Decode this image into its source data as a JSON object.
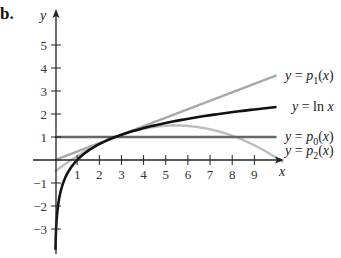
{
  "part_label": "b.",
  "chart_data": {
    "type": "line",
    "title": "",
    "xlabel": "x",
    "ylabel": "y",
    "xlim": [
      0,
      10.3
    ],
    "ylim": [
      -3.9,
      6.5
    ],
    "x_ticks": [
      1,
      2,
      3,
      4,
      5,
      6,
      7,
      8,
      9
    ],
    "y_ticks": [
      -3,
      -2,
      -1,
      1,
      2,
      3,
      4,
      5
    ],
    "grid": false,
    "legend_position": "right, inline labels at curve ends",
    "series": [
      {
        "name": "y = p1(x)",
        "label_main": "y = p",
        "label_sub": "1",
        "label_tail": "(x)",
        "expr": "x/e",
        "color": "#a8a8a8",
        "x_range": [
          0,
          10
        ],
        "points": [
          [
            0,
            0
          ],
          [
            2.718,
            1
          ],
          [
            5,
            1.84
          ],
          [
            10,
            3.68
          ]
        ]
      },
      {
        "name": "y = ln x",
        "label_main": "y = ln x",
        "label_sub": "",
        "label_tail": "",
        "expr": "ln(x)",
        "color": "#111111",
        "x_range": [
          0.02,
          10
        ],
        "points": [
          [
            0.02,
            -3.9
          ],
          [
            0.1,
            -2.3
          ],
          [
            0.5,
            -0.69
          ],
          [
            1,
            0
          ],
          [
            2.718,
            1
          ],
          [
            5,
            1.61
          ],
          [
            10,
            2.3
          ]
        ]
      },
      {
        "name": "y = p0(x)",
        "label_main": "y = p",
        "label_sub": "0",
        "label_tail": "(x)",
        "expr": "1",
        "color": "#666666",
        "x_range": [
          0,
          10
        ],
        "points": [
          [
            0,
            1
          ],
          [
            10,
            1
          ]
        ]
      },
      {
        "name": "y = p2(x)",
        "label_main": "y = p",
        "label_sub": "2",
        "label_tail": "(x)",
        "expr": "x/e - (x-e)^2/(2e^2)",
        "color": "#bdbdbd",
        "x_range": [
          0,
          10.3
        ],
        "points": [
          [
            0,
            -0.5
          ],
          [
            2.718,
            1
          ],
          [
            5.44,
            1.5
          ],
          [
            8,
            1.06
          ],
          [
            10.3,
            0.04
          ]
        ]
      }
    ]
  }
}
